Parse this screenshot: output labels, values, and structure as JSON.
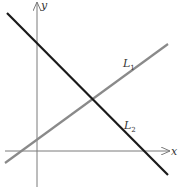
{
  "diagram": {
    "axes": {
      "x_label": "x",
      "y_label": "y",
      "color": "#7a7a7a"
    },
    "lines": [
      {
        "name": "L1",
        "label_main": "L",
        "label_sub": "1",
        "color": "#8a8a8a",
        "slope_sign": "positive"
      },
      {
        "name": "L2",
        "label_main": "L",
        "label_sub": "2",
        "color": "#1a1a1a",
        "slope_sign": "negative"
      }
    ]
  }
}
